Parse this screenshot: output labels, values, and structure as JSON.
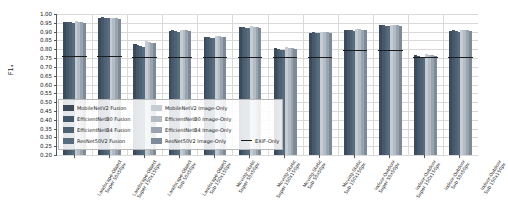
{
  "chart_data": {
    "type": "bar",
    "title": "",
    "xlabel": "",
    "ylabel": "F1ₐ",
    "ylim": [
      0.2,
      1.0
    ],
    "ytick_values": [
      0.2,
      0.25,
      0.3,
      0.35,
      0.4,
      0.45,
      0.5,
      0.55,
      0.6,
      0.65,
      0.7,
      0.75,
      0.8,
      0.85,
      0.9,
      0.95,
      1.0
    ],
    "ytick_labels": [
      "0.20",
      "0.25",
      "0.30",
      "0.35",
      "0.40",
      "0.45",
      "0.50",
      "0.55",
      "0.60",
      "0.65",
      "0.70",
      "0.75",
      "0.80",
      "0.85",
      "0.90",
      "0.95",
      "1.00"
    ],
    "grid": true,
    "legend_position": "lower-left-inside",
    "categories": [
      "Landscape-Object\nSuper 50x50px",
      "Landscape-Object\nSuper 150x150px",
      "Landscape-Object\nSub 50x50px",
      "Landscape-Object\nSub 150x150px",
      "Moving-Static\nSuper 50x50px",
      "Moving-Static\nSuper 150x150px",
      "Moving-Static\nSub 50x50px",
      "Moving-Static\nSub 150x150px",
      "Indoor-Outdoor\nSuper 50x50px",
      "Indoor-Outdoor\nSuper 150x150px",
      "Indoor-Outdoor\nSub 50x50px",
      "Indoor-Outdoor\nSub 150x150px"
    ],
    "series": [
      {
        "name": "MobileNetV2 Fusion",
        "color": "#3c4a5a",
        "values": [
          0.955,
          0.98,
          0.828,
          0.905,
          0.872,
          0.925,
          0.805,
          0.895,
          0.91,
          0.935,
          0.765,
          0.905
        ]
      },
      {
        "name": "EfficientNetB0 Fusion",
        "color": "#46586c",
        "values": [
          0.957,
          0.982,
          0.826,
          0.907,
          0.87,
          0.927,
          0.802,
          0.897,
          0.912,
          0.937,
          0.762,
          0.907
        ]
      },
      {
        "name": "EfficientNetB4 Fusion",
        "color": "#4f6274",
        "values": [
          0.952,
          0.978,
          0.82,
          0.903,
          0.866,
          0.922,
          0.798,
          0.893,
          0.908,
          0.933,
          0.758,
          0.903
        ]
      },
      {
        "name": "ResNet50V2 Fusion",
        "color": "#586c80",
        "values": [
          0.948,
          0.975,
          0.815,
          0.9,
          0.862,
          0.918,
          0.794,
          0.89,
          0.905,
          0.93,
          0.754,
          0.9
        ]
      },
      {
        "name": "MobileNetV2 Image-Only",
        "color": "#c6ccd4",
        "values": [
          0.958,
          0.98,
          0.845,
          0.912,
          0.878,
          0.93,
          0.812,
          0.9,
          0.915,
          0.94,
          0.772,
          0.912
        ]
      },
      {
        "name": "EfficientNetB0 Image-Only",
        "color": "#b3bbc5",
        "values": [
          0.956,
          0.978,
          0.842,
          0.91,
          0.875,
          0.928,
          0.809,
          0.898,
          0.913,
          0.938,
          0.769,
          0.91
        ]
      },
      {
        "name": "EfficientNetB4 Image-Only",
        "color": "#9aa4b0",
        "values": [
          0.952,
          0.976,
          0.838,
          0.907,
          0.872,
          0.925,
          0.806,
          0.896,
          0.911,
          0.935,
          0.766,
          0.907
        ]
      },
      {
        "name": "ResNet50V2 Image-Only",
        "color": "#7d8a98",
        "values": [
          0.949,
          0.972,
          0.834,
          0.904,
          0.869,
          0.922,
          0.803,
          0.893,
          0.908,
          0.932,
          0.763,
          0.904
        ]
      }
    ],
    "exif_only": {
      "name": "EXIF-Only",
      "color": "#1c1c1c",
      "values": [
        0.762,
        0.762,
        0.755,
        0.757,
        0.758,
        0.757,
        0.756,
        0.757,
        0.793,
        0.793,
        0.758,
        0.757
      ]
    }
  },
  "legend": {
    "columns": [
      [
        "MobileNetV2 Fusion",
        "EfficientNetB0 Fusion",
        "EfficientNetB4 Fusion",
        "ResNet50V2 Fusion"
      ],
      [
        "MobileNetV2 Image-Only",
        "EfficientNetB0 Image-Only",
        "EfficientNetB4 Image-Only",
        "ResNet50V2 Image-Only"
      ],
      [
        "EXIF-Only"
      ]
    ]
  }
}
